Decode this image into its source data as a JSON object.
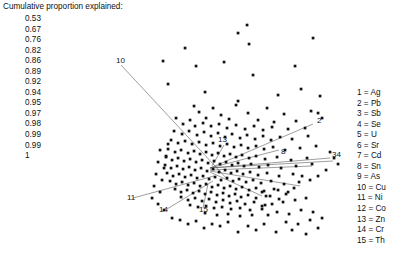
{
  "figure": {
    "background": "#ffffff",
    "point_color": "#111111",
    "vector_color": "#4d4d4d"
  },
  "cumulative": {
    "title": "Cumulative proportion explained:",
    "values": [
      "0.53",
      "0.67",
      "0.76",
      "0.82",
      "0.86",
      "0.89",
      "0.92",
      "0.94",
      "0.95",
      "0.97",
      "0.98",
      "0.99",
      "0.99",
      "1"
    ]
  },
  "legend": {
    "entries": [
      "1 = Ag",
      "2 = Pb",
      "3 = Sb",
      "4 = Se",
      "5 = U",
      "6 = Sr",
      "7 = Cd",
      "8 = Sn",
      "9 = As",
      "10 = Cu",
      "11 = Ni",
      "12 = Co",
      "13 = Zn",
      "14 = Cr",
      "15 = Th"
    ]
  },
  "chart_data": {
    "type": "scatter",
    "title": "",
    "xlabel": "",
    "ylabel": "",
    "xlim": [
      -1,
      1
    ],
    "ylim": [
      -1,
      1
    ],
    "grid": false,
    "legend_position": "right",
    "cumulative_proportion_explained": [
      0.53,
      0.67,
      0.76,
      0.82,
      0.86,
      0.89,
      0.92,
      0.94,
      0.95,
      0.97,
      0.98,
      0.99,
      0.99,
      1
    ],
    "variable_labels": {
      "1": "Ag",
      "2": "Pb",
      "3": "Sb",
      "4": "Se",
      "5": "U",
      "6": "Sr",
      "7": "Cd",
      "8": "Sn",
      "9": "As",
      "10": "Cu",
      "11": "Ni",
      "12": "Co",
      "13": "Zn",
      "14": "Cr",
      "15": "Th"
    },
    "loading_vectors": [
      {
        "id": "2",
        "label": "2",
        "x1": 210,
        "y1": 168,
        "x2": 313,
        "y2": 124,
        "lx": 317,
        "ly": 123
      },
      {
        "id": "8",
        "label": "8",
        "x1": 210,
        "y1": 168,
        "x2": 279,
        "y2": 150,
        "lx": 281,
        "ly": 154
      },
      {
        "id": "34",
        "label": "34",
        "x1": 210,
        "y1": 168,
        "x2": 330,
        "y2": 158,
        "lx": 332,
        "ly": 157
      },
      {
        "id": "5",
        "label": "",
        "x1": 210,
        "y1": 168,
        "x2": 333,
        "y2": 161,
        "lx": 0,
        "ly": 0
      },
      {
        "id": "10",
        "label": "10",
        "x1": 228,
        "y1": 180,
        "x2": 121,
        "y2": 65,
        "lx": 116,
        "ly": 63
      },
      {
        "id": "11",
        "label": "11",
        "x1": 214,
        "y1": 176,
        "x2": 133,
        "y2": 198,
        "lx": 127,
        "ly": 200
      },
      {
        "id": "14",
        "label": "14",
        "x1": 213,
        "y1": 181,
        "x2": 167,
        "y2": 209,
        "lx": 159,
        "ly": 212
      },
      {
        "id": "15",
        "label": "15",
        "x1": 208,
        "y1": 184,
        "x2": 203,
        "y2": 208,
        "lx": 199,
        "ly": 212
      },
      {
        "id": "13",
        "label": "13",
        "x1": 212,
        "y1": 166,
        "x2": 224,
        "y2": 145,
        "lx": 218,
        "ly": 142
      },
      {
        "id": "r1",
        "label": "",
        "x1": 210,
        "y1": 170,
        "x2": 312,
        "y2": 166,
        "lx": 0,
        "ly": 0
      },
      {
        "id": "r2",
        "label": "",
        "x1": 210,
        "y1": 171,
        "x2": 300,
        "y2": 186,
        "lx": 0,
        "ly": 0
      },
      {
        "id": "r3",
        "label": "",
        "x1": 210,
        "y1": 172,
        "x2": 262,
        "y2": 196,
        "lx": 0,
        "ly": 0
      }
    ],
    "points": [
      [
        238,
        33
      ],
      [
        247,
        25
      ],
      [
        249,
        44
      ],
      [
        185,
        48
      ],
      [
        313,
        38
      ],
      [
        163,
        61
      ],
      [
        196,
        66
      ],
      [
        224,
        62
      ],
      [
        295,
        66
      ],
      [
        253,
        75
      ],
      [
        301,
        89
      ],
      [
        168,
        84
      ],
      [
        205,
        92
      ],
      [
        278,
        95
      ],
      [
        320,
        96
      ],
      [
        238,
        101
      ],
      [
        236,
        105
      ],
      [
        194,
        106
      ],
      [
        267,
        108
      ],
      [
        311,
        111
      ],
      [
        199,
        112
      ],
      [
        213,
        108
      ],
      [
        221,
        115
      ],
      [
        248,
        113
      ],
      [
        284,
        114
      ],
      [
        176,
        118
      ],
      [
        190,
        120
      ],
      [
        206,
        118
      ],
      [
        229,
        119
      ],
      [
        258,
        120
      ],
      [
        274,
        122
      ],
      [
        296,
        121
      ],
      [
        318,
        113
      ],
      [
        322,
        118
      ],
      [
        183,
        124
      ],
      [
        195,
        126
      ],
      [
        203,
        123
      ],
      [
        211,
        126
      ],
      [
        219,
        124
      ],
      [
        227,
        128
      ],
      [
        236,
        125
      ],
      [
        245,
        129
      ],
      [
        254,
        126
      ],
      [
        263,
        130
      ],
      [
        272,
        127
      ],
      [
        288,
        129
      ],
      [
        305,
        128
      ],
      [
        174,
        131
      ],
      [
        182,
        134
      ],
      [
        189,
        131
      ],
      [
        197,
        135
      ],
      [
        204,
        132
      ],
      [
        211,
        136
      ],
      [
        218,
        133
      ],
      [
        225,
        137
      ],
      [
        232,
        134
      ],
      [
        240,
        138
      ],
      [
        247,
        135
      ],
      [
        255,
        139
      ],
      [
        263,
        136
      ],
      [
        271,
        140
      ],
      [
        280,
        137
      ],
      [
        292,
        139
      ],
      [
        308,
        136
      ],
      [
        171,
        140
      ],
      [
        178,
        143
      ],
      [
        185,
        141
      ],
      [
        192,
        144
      ],
      [
        199,
        142
      ],
      [
        206,
        145
      ],
      [
        213,
        143
      ],
      [
        220,
        146
      ],
      [
        227,
        144
      ],
      [
        234,
        147
      ],
      [
        241,
        145
      ],
      [
        248,
        148
      ],
      [
        256,
        146
      ],
      [
        264,
        149
      ],
      [
        273,
        147
      ],
      [
        285,
        150
      ],
      [
        300,
        148
      ],
      [
        316,
        146
      ],
      [
        168,
        149
      ],
      [
        175,
        152
      ],
      [
        181,
        150
      ],
      [
        188,
        153
      ],
      [
        194,
        151
      ],
      [
        200,
        154
      ],
      [
        206,
        152
      ],
      [
        212,
        155
      ],
      [
        218,
        153
      ],
      [
        224,
        156
      ],
      [
        230,
        154
      ],
      [
        236,
        157
      ],
      [
        242,
        155
      ],
      [
        249,
        158
      ],
      [
        256,
        156
      ],
      [
        265,
        159
      ],
      [
        277,
        157
      ],
      [
        291,
        160
      ],
      [
        307,
        158
      ],
      [
        166,
        157
      ],
      [
        172,
        160
      ],
      [
        178,
        158
      ],
      [
        184,
        161
      ],
      [
        190,
        159
      ],
      [
        196,
        162
      ],
      [
        202,
        160
      ],
      [
        208,
        163
      ],
      [
        214,
        161
      ],
      [
        220,
        164
      ],
      [
        226,
        162
      ],
      [
        232,
        165
      ],
      [
        238,
        163
      ],
      [
        244,
        166
      ],
      [
        251,
        164
      ],
      [
        259,
        167
      ],
      [
        268,
        165
      ],
      [
        281,
        168
      ],
      [
        296,
        166
      ],
      [
        312,
        164
      ],
      [
        165,
        165
      ],
      [
        171,
        168
      ],
      [
        177,
        166
      ],
      [
        183,
        169
      ],
      [
        189,
        167
      ],
      [
        195,
        170
      ],
      [
        201,
        168
      ],
      [
        207,
        171
      ],
      [
        213,
        169
      ],
      [
        219,
        172
      ],
      [
        225,
        170
      ],
      [
        231,
        173
      ],
      [
        237,
        171
      ],
      [
        243,
        174
      ],
      [
        250,
        172
      ],
      [
        258,
        175
      ],
      [
        267,
        173
      ],
      [
        279,
        176
      ],
      [
        293,
        174
      ],
      [
        167,
        173
      ],
      [
        173,
        176
      ],
      [
        179,
        174
      ],
      [
        185,
        177
      ],
      [
        191,
        175
      ],
      [
        197,
        178
      ],
      [
        203,
        176
      ],
      [
        209,
        179
      ],
      [
        215,
        177
      ],
      [
        221,
        180
      ],
      [
        227,
        178
      ],
      [
        233,
        181
      ],
      [
        239,
        179
      ],
      [
        246,
        182
      ],
      [
        253,
        180
      ],
      [
        261,
        183
      ],
      [
        271,
        181
      ],
      [
        284,
        184
      ],
      [
        299,
        182
      ],
      [
        170,
        181
      ],
      [
        176,
        184
      ],
      [
        182,
        182
      ],
      [
        188,
        185
      ],
      [
        194,
        183
      ],
      [
        200,
        186
      ],
      [
        206,
        184
      ],
      [
        212,
        187
      ],
      [
        218,
        185
      ],
      [
        224,
        188
      ],
      [
        230,
        186
      ],
      [
        236,
        189
      ],
      [
        242,
        187
      ],
      [
        249,
        190
      ],
      [
        256,
        188
      ],
      [
        264,
        191
      ],
      [
        274,
        189
      ],
      [
        288,
        192
      ],
      [
        175,
        189
      ],
      [
        181,
        192
      ],
      [
        187,
        190
      ],
      [
        193,
        193
      ],
      [
        199,
        191
      ],
      [
        205,
        194
      ],
      [
        211,
        192
      ],
      [
        217,
        195
      ],
      [
        223,
        193
      ],
      [
        229,
        196
      ],
      [
        235,
        194
      ],
      [
        241,
        197
      ],
      [
        248,
        195
      ],
      [
        256,
        198
      ],
      [
        266,
        196
      ],
      [
        279,
        199
      ],
      [
        181,
        197
      ],
      [
        188,
        200
      ],
      [
        195,
        198
      ],
      [
        202,
        201
      ],
      [
        209,
        199
      ],
      [
        216,
        202
      ],
      [
        223,
        200
      ],
      [
        230,
        203
      ],
      [
        237,
        201
      ],
      [
        245,
        204
      ],
      [
        254,
        202
      ],
      [
        265,
        205
      ],
      [
        190,
        205
      ],
      [
        198,
        207
      ],
      [
        206,
        206
      ],
      [
        214,
        208
      ],
      [
        222,
        207
      ],
      [
        231,
        209
      ],
      [
        240,
        208
      ],
      [
        250,
        210
      ],
      [
        262,
        209
      ],
      [
        205,
        213
      ],
      [
        217,
        215
      ],
      [
        228,
        214
      ],
      [
        240,
        216
      ],
      [
        252,
        215
      ],
      [
        262,
        206
      ],
      [
        272,
        204
      ],
      [
        283,
        202
      ],
      [
        295,
        200
      ],
      [
        306,
        198
      ],
      [
        268,
        215
      ],
      [
        277,
        212
      ],
      [
        289,
        214
      ],
      [
        301,
        210
      ],
      [
        313,
        212
      ],
      [
        286,
        222
      ],
      [
        298,
        224
      ],
      [
        310,
        220
      ],
      [
        322,
        218
      ],
      [
        276,
        232
      ],
      [
        292,
        230
      ],
      [
        306,
        234
      ],
      [
        318,
        228
      ],
      [
        264,
        224
      ],
      [
        256,
        230
      ],
      [
        248,
        226
      ],
      [
        238,
        232
      ],
      [
        228,
        222
      ],
      [
        220,
        226
      ],
      [
        212,
        224
      ],
      [
        204,
        228
      ],
      [
        196,
        221
      ],
      [
        188,
        224
      ],
      [
        180,
        220
      ],
      [
        172,
        218
      ],
      [
        164,
        210
      ],
      [
        158,
        204
      ],
      [
        152,
        198
      ],
      [
        160,
        192
      ],
      [
        154,
        186
      ],
      [
        162,
        180
      ],
      [
        156,
        174
      ],
      [
        164,
        168
      ],
      [
        158,
        162
      ],
      [
        166,
        156
      ],
      [
        160,
        150
      ],
      [
        168,
        144
      ],
      [
        330,
        152
      ],
      [
        334,
        158
      ],
      [
        338,
        164
      ],
      [
        326,
        170
      ],
      [
        318,
        176
      ],
      [
        310,
        180
      ],
      [
        302,
        176
      ],
      [
        294,
        188
      ],
      [
        286,
        194
      ],
      [
        278,
        190
      ],
      [
        270,
        196
      ],
      [
        262,
        192
      ]
    ]
  }
}
